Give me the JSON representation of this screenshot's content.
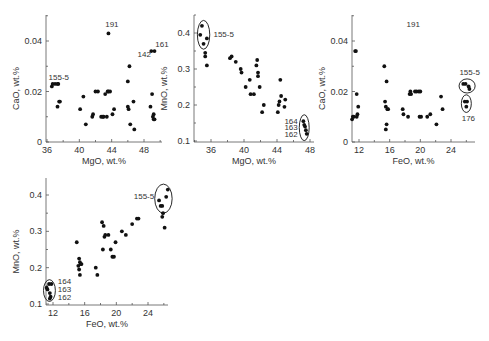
{
  "figure": {
    "width": 489,
    "height": 341,
    "point_color": "#111111",
    "axis_color": "#555555",
    "text_color": "#333333"
  },
  "chart_data": [
    {
      "id": "cao-vs-mgo",
      "type": "scatter",
      "title": "",
      "xlabel": "MgO, wt.%",
      "ylabel": "CaO, wt.%",
      "xlim": [
        36,
        50
      ],
      "ylim": [
        0,
        0.05
      ],
      "xticks": [
        36,
        40,
        44,
        48
      ],
      "yticks": [
        0,
        0.02,
        0.04
      ],
      "ytick_labels": [
        "0",
        "0.02",
        "0.04"
      ],
      "grid": false,
      "frame": {
        "x0": 46,
        "x1": 162,
        "y0": 15,
        "y1": 142,
        "xpx": [
          47,
          144
        ],
        "ypx": [
          142,
          41
        ]
      },
      "x": [
        36.6,
        36.7,
        37.0,
        37.3,
        37.4,
        37.5,
        37.6,
        37.3,
        40.1,
        40.5,
        40.8,
        41.6,
        41.7,
        42.0,
        42.3,
        42.7,
        42.9,
        43.0,
        43.2,
        43.4,
        43.5,
        43.6,
        43.8,
        44.1,
        44.3,
        46.0,
        46.0,
        46.1,
        46.2,
        46.3,
        46.7,
        46.8,
        48.8,
        49.0,
        49.2,
        49.1,
        49.2,
        49.3,
        43.6,
        48.9,
        49.3
      ],
      "y": [
        0.022,
        0.023,
        0.023,
        0.023,
        0.023,
        0.016,
        0.016,
        0.014,
        0.013,
        0.018,
        0.007,
        0.01,
        0.011,
        0.02,
        0.02,
        0.01,
        0.01,
        0.01,
        0.019,
        0.01,
        0.02,
        0.02,
        0.02,
        0.011,
        0.013,
        0.024,
        0.014,
        0.013,
        0.03,
        0.007,
        0.016,
        0.005,
        0.014,
        0.019,
        0.011,
        0.01,
        0.009,
        0.009,
        0.043,
        0.036,
        0.036
      ],
      "annotations": [
        {
          "text": "155-5",
          "x": 36.2,
          "y": 0.0245
        },
        {
          "text": "191",
          "x": 43.2,
          "y": 0.0455
        },
        {
          "text": "142",
          "x": 47.2,
          "y": 0.0335
        },
        {
          "text": "161",
          "x": 49.4,
          "y": 0.0375
        }
      ],
      "ellipses": []
    },
    {
      "id": "mno-vs-mgo",
      "type": "scatter",
      "title": "",
      "xlabel": "MgO, wt.%",
      "ylabel": "MnO, wt.%",
      "xlim": [
        34,
        48.5
      ],
      "ylim": [
        0.1,
        0.45
      ],
      "xticks": [
        36,
        40,
        44,
        48
      ],
      "yticks": [
        0.1,
        0.2,
        0.3,
        0.4
      ],
      "ytick_labels": [
        "0.1",
        "0.2",
        "0.3",
        "0.4"
      ],
      "grid": false,
      "frame": {
        "x0": 194,
        "x1": 314,
        "y0": 15,
        "y1": 142,
        "xpx": [
          211,
          310
        ],
        "ypx": [
          141,
          33
        ]
      },
      "x": [
        34.9,
        34.7,
        35.1,
        35.5,
        35.3,
        35.3,
        35.5,
        38.3,
        38.5,
        39.0,
        39.6,
        39.7,
        40.2,
        40.7,
        40.8,
        41.2,
        41.6,
        41.5,
        41.7,
        41.7,
        41.9,
        42.2,
        42.4,
        44.1,
        44.2,
        44.3,
        44.4,
        44.5,
        45.0,
        44.9,
        47.2,
        47.3,
        47.4,
        47.5,
        47.6
      ],
      "y": [
        0.42,
        0.395,
        0.37,
        0.385,
        0.345,
        0.335,
        0.31,
        0.33,
        0.335,
        0.32,
        0.3,
        0.29,
        0.25,
        0.27,
        0.23,
        0.23,
        0.325,
        0.31,
        0.29,
        0.28,
        0.25,
        0.18,
        0.2,
        0.18,
        0.2,
        0.21,
        0.27,
        0.225,
        0.215,
        0.195,
        0.155,
        0.145,
        0.14,
        0.13,
        0.12
      ],
      "annotations": [
        {
          "text": "155-5",
          "x": 36.3,
          "y": 0.39
        },
        {
          "text": "164",
          "x": 44.9,
          "y": 0.148
        },
        {
          "text": "163",
          "x": 44.9,
          "y": 0.13
        },
        {
          "text": "162",
          "x": 44.9,
          "y": 0.111
        }
      ],
      "ellipses": [
        {
          "cx": 35.1,
          "cy": 0.395,
          "rx": 0.75,
          "ry": 0.04
        },
        {
          "cx": 47.3,
          "cy": 0.137,
          "rx": 0.6,
          "ry": 0.036
        }
      ]
    },
    {
      "id": "cao-vs-feo",
      "type": "scatter",
      "title": "",
      "xlabel": "FeO, wt.%",
      "ylabel": "CaO, wt.%",
      "xlim": [
        11,
        27.5
      ],
      "ylim": [
        0,
        0.05
      ],
      "xticks": [
        12,
        16,
        20,
        24
      ],
      "yticks": [
        0,
        0.02,
        0.04
      ],
      "ytick_labels": [
        "0",
        "0.02",
        "0.04"
      ],
      "grid": false,
      "frame": {
        "x0": 352,
        "x1": 475,
        "y0": 15,
        "y1": 142,
        "xpx": [
          359,
          451
        ],
        "ypx": [
          142,
          41
        ]
      },
      "x": [
        11.1,
        11.2,
        11.3,
        11.5,
        11.6,
        11.7,
        11.8,
        11.9,
        11.7,
        15.3,
        15.4,
        15.5,
        15.6,
        15.5,
        15.6,
        15.7,
        15.8,
        17.7,
        17.8,
        18.4,
        18.6,
        18.7,
        18.8,
        19.3,
        19.5,
        19.8,
        20.0,
        19.9,
        20.1,
        20.9,
        21.3,
        22.1,
        22.7,
        22.9,
        25.6,
        25.9,
        26.3,
        26.4,
        25.8,
        26.1,
        26.0
      ],
      "y": [
        0.009,
        0.01,
        0.01,
        0.036,
        0.036,
        0.019,
        0.011,
        0.014,
        0.01,
        0.03,
        0.016,
        0.014,
        0.007,
        0.005,
        0.024,
        0.013,
        0.013,
        0.013,
        0.011,
        0.01,
        0.019,
        0.02,
        0.019,
        0.02,
        0.02,
        0.02,
        0.02,
        0.01,
        0.01,
        0.01,
        0.011,
        0.007,
        0.018,
        0.013,
        0.023,
        0.023,
        0.022,
        0.021,
        0.016,
        0.016,
        0.014
      ],
      "annotations": [
        {
          "text": "191",
          "x": 18.2,
          "y": 0.0455
        },
        {
          "text": "155-5",
          "x": 25.1,
          "y": 0.0265
        },
        {
          "text": "176",
          "x": 25.4,
          "y": 0.0085
        }
      ],
      "ellipses": [
        {
          "cx": 26.1,
          "cy": 0.0222,
          "rx": 1.05,
          "ry": 0.0028
        },
        {
          "cx": 26.0,
          "cy": 0.0152,
          "rx": 0.65,
          "ry": 0.0035
        }
      ]
    },
    {
      "id": "mno-vs-feo",
      "type": "scatter",
      "title": "",
      "xlabel": "FeO, wt.%",
      "ylabel": "MnO, wt.%",
      "xlim": [
        11,
        27.5
      ],
      "ylim": [
        0.1,
        0.45
      ],
      "xticks": [
        12,
        16,
        20,
        24
      ],
      "yticks": [
        0.1,
        0.2,
        0.3,
        0.4
      ],
      "ytick_labels": [
        "0.1",
        "0.2",
        "0.3",
        "0.4"
      ],
      "grid": false,
      "frame": {
        "x0": 46,
        "x1": 168,
        "y0": 178,
        "y1": 305,
        "xpx": [
          53,
          148
        ],
        "ypx": [
          304,
          195
        ]
      },
      "x": [
        11.2,
        11.3,
        11.5,
        11.6,
        11.7,
        11.8,
        11.6,
        15.0,
        15.2,
        15.3,
        15.3,
        15.4,
        15.5,
        15.6,
        15.4,
        17.4,
        17.6,
        18.2,
        18.3,
        18.4,
        18.5,
        18.6,
        19.0,
        19.3,
        19.5,
        19.7,
        19.9,
        20.7,
        21.2,
        22.0,
        22.6,
        22.8,
        25.4,
        25.6,
        25.8,
        25.9,
        26.1,
        26.3,
        26.5,
        25.8
      ],
      "y": [
        0.145,
        0.14,
        0.155,
        0.13,
        0.12,
        0.155,
        0.115,
        0.27,
        0.205,
        0.195,
        0.225,
        0.215,
        0.21,
        0.21,
        0.18,
        0.2,
        0.18,
        0.325,
        0.25,
        0.315,
        0.285,
        0.29,
        0.29,
        0.25,
        0.23,
        0.23,
        0.27,
        0.3,
        0.29,
        0.32,
        0.335,
        0.335,
        0.385,
        0.37,
        0.34,
        0.35,
        0.31,
        0.395,
        0.415,
        0.37
      ],
      "annotations": [
        {
          "text": "155-5",
          "x": 22.2,
          "y": 0.39
        },
        {
          "text": "164",
          "x": 12.6,
          "y": 0.155
        },
        {
          "text": "163",
          "x": 12.6,
          "y": 0.134
        },
        {
          "text": "162",
          "x": 12.6,
          "y": 0.112
        }
      ],
      "ellipses": [
        {
          "cx": 25.95,
          "cy": 0.39,
          "rx": 1.1,
          "ry": 0.04
        },
        {
          "cx": 11.55,
          "cy": 0.137,
          "rx": 0.75,
          "ry": 0.03
        }
      ]
    }
  ]
}
